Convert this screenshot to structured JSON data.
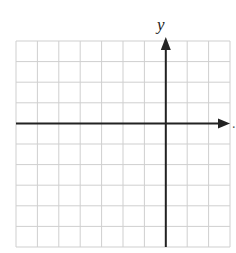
{
  "diagram": {
    "type": "coordinate-plane",
    "y_axis_label": "y",
    "x_axis_trailing_mark": ".",
    "grid": {
      "columns": 10,
      "rows": 10,
      "left": 16,
      "top": 41,
      "right": 230,
      "bottom": 247,
      "line_color": "#cfcfcf"
    },
    "axes": {
      "color": "#222222",
      "x_axis_row_index": 4,
      "y_axis_col_index": 7,
      "x_arrow": "right",
      "y_arrow": "up"
    }
  }
}
